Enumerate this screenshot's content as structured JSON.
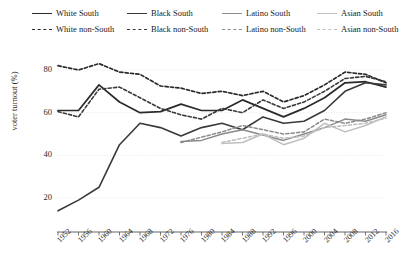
{
  "chart_data": {
    "type": "line",
    "title": "",
    "xlabel": "",
    "ylabel": "voter turnout (%)",
    "xlim": [
      1952,
      2016
    ],
    "ylim": [
      8,
      88
    ],
    "yticks": [
      20,
      40,
      60,
      80
    ],
    "grid": true,
    "legend_position": "top",
    "x": [
      1952,
      1956,
      1960,
      1964,
      1968,
      1972,
      1976,
      1980,
      1984,
      1988,
      1992,
      1996,
      2000,
      2004,
      2008,
      2012,
      2016
    ],
    "xtick_labels": [
      "1952",
      "1956",
      "1960",
      "1964",
      "1968",
      "1972",
      "1976",
      "1980",
      "1984",
      "1988",
      "1992",
      "1996",
      "2000",
      "2004",
      "2008",
      "2012",
      "2016"
    ],
    "series": [
      {
        "name": "White South",
        "color": "#2b2b2b",
        "dash": "solid",
        "width": 1.7,
        "values": [
          61,
          61,
          73,
          65,
          60,
          60.5,
          64,
          61,
          61,
          66,
          62,
          58,
          62,
          67,
          74,
          74.5,
          72
        ]
      },
      {
        "name": "White non-South",
        "color": "#2b2b2b",
        "dash": "dashed",
        "width": 1.7,
        "values": [
          82,
          80,
          83,
          79,
          78,
          72.5,
          71.5,
          69,
          70,
          68,
          70,
          65,
          68,
          73,
          79,
          78,
          74
        ]
      },
      {
        "name": "Black South",
        "color": "#3a3a3a",
        "dash": "solid",
        "width": 1.6,
        "values": [
          14,
          19,
          25,
          45,
          55,
          53,
          49,
          53,
          55,
          52,
          58,
          55,
          56,
          61,
          70,
          74,
          73
        ]
      },
      {
        "name": "Black non-South",
        "color": "#3a3a3a",
        "dash": "dashed",
        "width": 1.6,
        "values": [
          60.5,
          58,
          71,
          72,
          67,
          62,
          59,
          57,
          62,
          60,
          66,
          62,
          65,
          70,
          76,
          77,
          74.5
        ]
      },
      {
        "name": "Latino South",
        "color": "#8a8a8a",
        "dash": "solid",
        "width": 1.5,
        "values": [
          null,
          null,
          null,
          null,
          null,
          null,
          46.5,
          47,
          50,
          52,
          49.5,
          47,
          50,
          53,
          57,
          56,
          59
        ]
      },
      {
        "name": "Latino non-South",
        "color": "#8a8a8a",
        "dash": "dashed",
        "width": 1.5,
        "values": [
          null,
          null,
          null,
          null,
          null,
          null,
          46,
          48.5,
          51,
          54,
          52,
          50,
          51,
          57,
          55,
          57,
          60
        ]
      },
      {
        "name": "Asian South",
        "color": "#bfbfbf",
        "dash": "solid",
        "width": 1.5,
        "values": [
          null,
          null,
          null,
          null,
          null,
          null,
          null,
          null,
          45.5,
          46,
          50,
          45,
          48,
          55,
          51,
          54,
          58
        ]
      },
      {
        "name": "Asian non-South",
        "color": "#bfbfbf",
        "dash": "dashed",
        "width": 1.5,
        "values": [
          null,
          null,
          null,
          null,
          null,
          null,
          null,
          null,
          46,
          48,
          50,
          48,
          49,
          53,
          54,
          55,
          57.5
        ]
      }
    ]
  },
  "legend": {
    "row1": [
      {
        "label": "White South",
        "color": "#2b2b2b",
        "dash": "solid"
      },
      {
        "label": "Black South",
        "color": "#3a3a3a",
        "dash": "solid"
      },
      {
        "label": "Latino South",
        "color": "#8a8a8a",
        "dash": "solid"
      },
      {
        "label": "Asian South",
        "color": "#bfbfbf",
        "dash": "solid"
      }
    ],
    "row2": [
      {
        "label": "White non-South",
        "color": "#2b2b2b",
        "dash": "dashed"
      },
      {
        "label": "Black non-South",
        "color": "#3a3a3a",
        "dash": "dashed"
      },
      {
        "label": "Latino non-South",
        "color": "#8a8a8a",
        "dash": "dashed"
      },
      {
        "label": "Asian non-South",
        "color": "#bfbfbf",
        "dash": "dashed"
      }
    ]
  },
  "axes": {
    "y_axis_title": "voter turnout (%)",
    "y_tick_labels": [
      "80",
      "60",
      "40",
      "20"
    ],
    "axis_color": "#555555",
    "grid_color": "#dddddd"
  }
}
